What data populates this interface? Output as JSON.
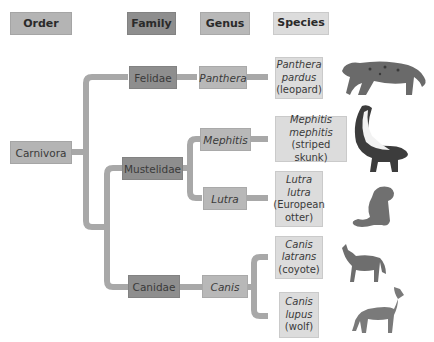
{
  "headers": {
    "order": "Order",
    "family": "Family",
    "genus": "Genus",
    "species": "Species"
  },
  "colors": {
    "order": "#b4b4b4",
    "family": "#8e8e8e",
    "genus": "#b8b8b8",
    "species": "#dcdcdc",
    "connector": "#a8a8a8"
  },
  "order": {
    "name": "Carnivora"
  },
  "families": [
    {
      "name": "Felidae"
    },
    {
      "name": "Mustelidae"
    },
    {
      "name": "Canidae"
    }
  ],
  "genera": [
    {
      "name": "Panthera"
    },
    {
      "name": "Mephitis"
    },
    {
      "name": "Lutra"
    },
    {
      "name": "Canis"
    }
  ],
  "species": [
    {
      "line1": "Panthera",
      "line2": "pardus",
      "common": "(leopard)",
      "animal": "leopard-illustration"
    },
    {
      "line1": "Mephitis",
      "line2": "mephitis",
      "common": "(striped skunk)",
      "animal": "skunk-illustration"
    },
    {
      "line1": "Lutra",
      "line2": "lutra",
      "common": "(European",
      "common2": "otter)",
      "animal": "otter-illustration"
    },
    {
      "line1": "Canis",
      "line2": "latrans",
      "common": "(coyote)",
      "animal": "coyote-illustration"
    },
    {
      "line1": "Canis",
      "line2": "lupus",
      "common": "(wolf)",
      "animal": "wolf-illustration"
    }
  ]
}
